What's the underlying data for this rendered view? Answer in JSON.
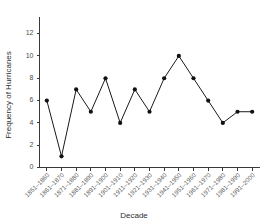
{
  "chart_data": {
    "type": "line",
    "title": "",
    "xlabel": "Decade",
    "ylabel": "Frequency of Hurricanes",
    "categories": [
      "1851–1860",
      "1861–1870",
      "1871–1880",
      "1881–1890",
      "1891–1900",
      "1901–1910",
      "1911–1920",
      "1921–1930",
      "1931–1940",
      "1941–1950",
      "1951–1960",
      "1961–1970",
      "1971–1980",
      "1981–1990",
      "1991–2000"
    ],
    "values": [
      6,
      1,
      7,
      5,
      8,
      4,
      7,
      5,
      8,
      10,
      8,
      6,
      4,
      5,
      5
    ],
    "ylim": [
      0,
      13
    ],
    "ytick_labels": [
      "0",
      "2",
      "4",
      "6",
      "8",
      "10",
      "12"
    ],
    "ytick_values": [
      0,
      2,
      4,
      6,
      8,
      10,
      12
    ],
    "grid": false,
    "legend": "none",
    "marker": "filled-circle",
    "line_color": "#1a1a1a",
    "marker_color": "#111111",
    "axis_color": "#3a3a3a",
    "background_color": "#ffffff"
  }
}
